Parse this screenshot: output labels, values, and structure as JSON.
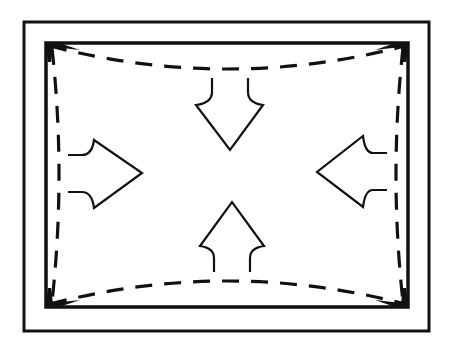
{
  "diagram": {
    "title": "",
    "colors": {
      "line": "#111111",
      "background": "#ffffff"
    },
    "elements": {
      "outer_frame": {
        "x": 24,
        "y": 22,
        "width": 405,
        "height": 309
      },
      "inner_frame": {
        "x": 46,
        "y": 43,
        "width": 362,
        "height": 264
      },
      "distorted_outline": "dashed",
      "arrows": [
        {
          "direction": "down",
          "position": "top"
        },
        {
          "direction": "right",
          "position": "left"
        },
        {
          "direction": "left",
          "position": "right"
        },
        {
          "direction": "up",
          "position": "bottom"
        }
      ]
    }
  }
}
